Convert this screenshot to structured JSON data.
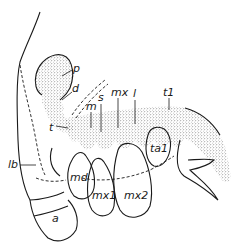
{
  "figure": {
    "type": "anatomical line drawing (stippled)",
    "labels": {
      "p": "p",
      "d": "d",
      "m": "m",
      "s": "s",
      "mx": "mx",
      "l": "l",
      "t1": "t1",
      "t": "t",
      "lb": "lb",
      "md": "md",
      "mx1": "mx1",
      "mx2": "mx2",
      "ta1": "ta1",
      "a": "a"
    },
    "colors": {
      "ink": "#1a1a1a",
      "background": "#ffffff"
    }
  }
}
